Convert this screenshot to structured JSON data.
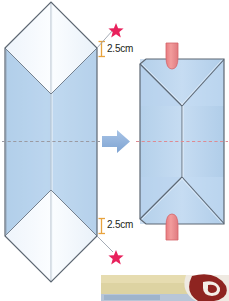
{
  "figure": {
    "type": "origami-instruction",
    "steps": 2
  },
  "measurements": {
    "top": {
      "label": "2.5cm",
      "value": 2.5,
      "unit": "cm"
    },
    "bottom": {
      "label": "2.5cm",
      "value": 2.5,
      "unit": "cm"
    }
  },
  "markers": {
    "star_top": "star-icon",
    "star_bottom": "star-icon",
    "arrow": "arrow-right-icon",
    "tab_top": "tab-icon",
    "tab_bottom": "tab-icon"
  },
  "colors": {
    "paper_blue": "#bcd6ee",
    "paper_blue_dark": "#a9c9e6",
    "paper_white": "#f2f7fc",
    "outline": "#5a6472",
    "fold_line": "#d6d2d2",
    "dash_line_left": "#9a9aa2",
    "dash_line_right": "#e08a92",
    "bracket": "#e8a33d",
    "star": "#e8215c",
    "tab_pink": "#ef8f8f",
    "tab_pink_edge": "#d4646a",
    "arrow_blue": "#92b4dd",
    "text": "#231f20",
    "photo_cream": "#e0d7a8",
    "photo_red": "#8e2420",
    "photo_white": "#efeae0"
  },
  "left_shape": {
    "name": "unfolded-paper",
    "description": "Elongated hexagon with pointed top and bottom, white triangular flaps, blue body, vertical center fold"
  },
  "right_shape": {
    "name": "folded-envelope",
    "description": "Rectangular envelope with folded-in triangular flaps top and bottom"
  }
}
